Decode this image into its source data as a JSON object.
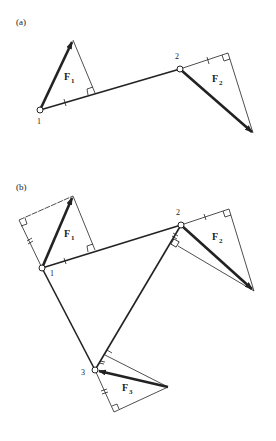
{
  "diagram": {
    "colors": {
      "ink": "#222222",
      "background": "#ffffff"
    },
    "panels": [
      {
        "label": "(a)",
        "nodes": [
          {
            "id": "1",
            "label": "1"
          },
          {
            "id": "2",
            "label": "2"
          }
        ],
        "forces": [
          {
            "name": "F",
            "subscript": "1",
            "at_node": "1"
          },
          {
            "name": "F",
            "subscript": "2",
            "at_node": "2"
          }
        ],
        "members": [
          [
            "1",
            "2"
          ]
        ]
      },
      {
        "label": "(b)",
        "nodes": [
          {
            "id": "1",
            "label": "1"
          },
          {
            "id": "2",
            "label": "2"
          },
          {
            "id": "3",
            "label": "3"
          }
        ],
        "forces": [
          {
            "name": "F",
            "subscript": "1",
            "at_node": "1"
          },
          {
            "name": "F",
            "subscript": "2",
            "at_node": "2"
          },
          {
            "name": "F",
            "subscript": "3",
            "at_node": "3"
          }
        ],
        "members": [
          [
            "1",
            "2"
          ],
          [
            "2",
            "3"
          ],
          [
            "1",
            "3"
          ]
        ]
      }
    ]
  }
}
